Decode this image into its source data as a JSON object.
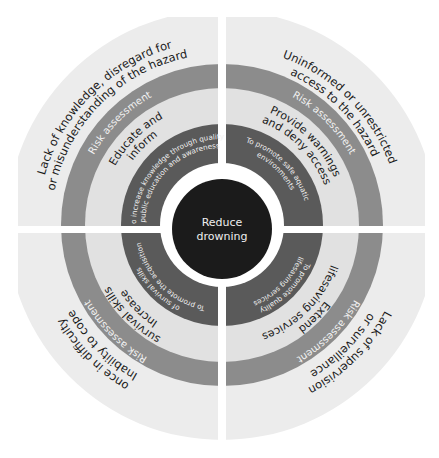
{
  "center": {
    "line1": "Reduce",
    "line2": "drowning"
  },
  "colors": {
    "outer_band": "#ececec",
    "risk_band": "#8c8c8c",
    "action_band": "#e1e1e1",
    "goal_band": "#5a5a5a",
    "center_circle": "#1b1b1b",
    "separator": "#ffffff"
  },
  "quadrants": [
    {
      "position": "top-left",
      "hazard_line1": "Lack of knowledge, disregard for",
      "hazard_line2": "or misunderstanding of the hazard",
      "risk_label": "Risk assessment",
      "action_line1": "Educate and",
      "action_line2": "inform",
      "goal_line1": "To increase knowledge through quality",
      "goal_line2": "public education and awareness"
    },
    {
      "position": "top-right",
      "hazard_line1": "Uninformed or unrestricted",
      "hazard_line2": "access to the hazard",
      "risk_label": "Risk assessment",
      "action_line1": "Provide warnings",
      "action_line2": "and deny access",
      "goal_line1": "To promote safe aquatic",
      "goal_line2": "environments"
    },
    {
      "position": "bottom-right",
      "hazard_line1": "Lack of supervision",
      "hazard_line2": "or surveillance",
      "risk_label": "Risk assessment",
      "action_line1": "Extend",
      "action_line2": "lifesaving services",
      "goal_line1": "To promote quality",
      "goal_line2": "lifesaving services"
    },
    {
      "position": "bottom-left",
      "hazard_line1": "Inability to cope",
      "hazard_line2": "once in difficulty",
      "risk_label": "Risk assessment",
      "action_line1": "Increase",
      "action_line2": "survival skills",
      "goal_line1": "To promote the acquisition",
      "goal_line2": "of survival skills"
    }
  ]
}
